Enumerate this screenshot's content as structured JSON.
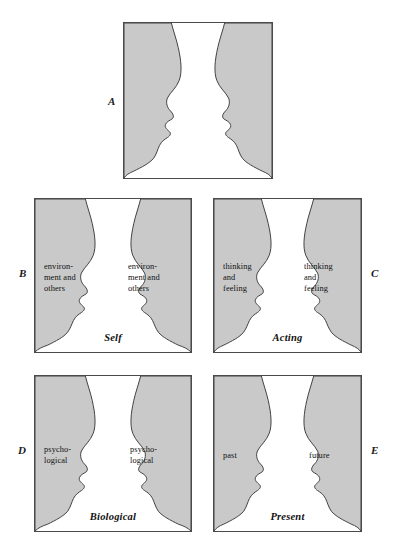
{
  "figure": {
    "colors": {
      "face_fill": "#c9c9c9",
      "vase_fill": "#ffffff",
      "outline": "#3f3f3f",
      "panel_border": "#4a4a4a",
      "text": "#101010",
      "background": "#ffffff"
    },
    "panels": [
      {
        "id": "A",
        "letter": "A",
        "letter_side": "left",
        "left_label": "",
        "right_label": "",
        "bottom_label": ""
      },
      {
        "id": "B",
        "letter": "B",
        "letter_side": "left",
        "left_label": "environ-\nment and\nothers",
        "right_label": "environ-\nment and\nothers",
        "bottom_label": "Self"
      },
      {
        "id": "C",
        "letter": "C",
        "letter_side": "right",
        "left_label": "thinking\nand\nfeeling",
        "right_label": "thinking\nand\nfeeling",
        "bottom_label": "Acting"
      },
      {
        "id": "D",
        "letter": "D",
        "letter_side": "left",
        "left_label": "psycho-\nlogical",
        "right_label": "psycho-\nlogical",
        "bottom_label": "Biological"
      },
      {
        "id": "E",
        "letter": "E",
        "letter_side": "right",
        "left_label": "past",
        "right_label": "future",
        "bottom_label": "Present"
      }
    ]
  }
}
